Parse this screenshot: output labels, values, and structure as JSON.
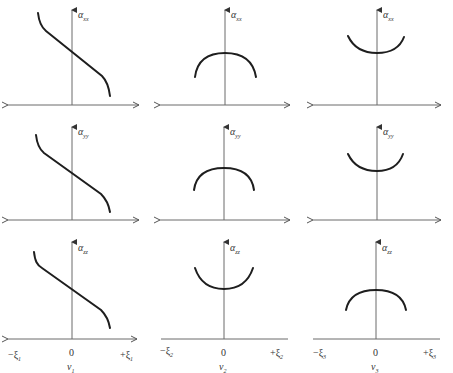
{
  "figure": {
    "columns": [
      {
        "x_axis_left_label": "−ξ",
        "x_axis_left_sub": "1",
        "x_axis_right_label": "+ξ",
        "x_axis_right_sub": "1",
        "origin_label": "0",
        "var_label": "ν",
        "var_sub": "1"
      },
      {
        "x_axis_left_label": "−ξ",
        "x_axis_left_sub": "2",
        "x_axis_right_label": "+ξ",
        "x_axis_right_sub": "2",
        "origin_label": "0",
        "var_label": "ν",
        "var_sub": "2"
      },
      {
        "x_axis_left_label": "−ξ",
        "x_axis_left_sub": "3",
        "x_axis_right_label": "+ξ",
        "x_axis_right_sub": "3",
        "origin_label": "0",
        "var_label": "ν",
        "var_sub": "3"
      }
    ],
    "rows": [
      {
        "y_label": "α",
        "y_sub": "xx",
        "shapes": [
          "decreasing-s",
          "arch-down",
          "bowl-up"
        ]
      },
      {
        "y_label": "α",
        "y_sub": "yy",
        "shapes": [
          "decreasing-s",
          "arch-down",
          "bowl-up"
        ]
      },
      {
        "y_label": "α",
        "y_sub": "zz",
        "shapes": [
          "decreasing-s",
          "bowl-up",
          "arch-down"
        ]
      }
    ],
    "colors": {
      "curve": "#1e1e1e",
      "axis": "#6a6a6a",
      "background": "#ffffff"
    }
  }
}
